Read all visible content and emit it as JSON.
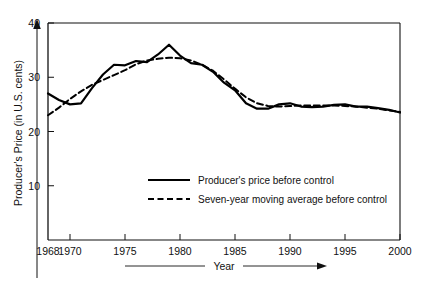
{
  "chart_data": {
    "type": "line",
    "title": "",
    "xlabel": "Year",
    "ylabel": "Producer's Price (in U.S. cents)",
    "xlim": [
      1968,
      2000
    ],
    "ylim": [
      0,
      40
    ],
    "grid": false,
    "legend_position": "center",
    "xticks": [
      1968,
      1970,
      1975,
      1980,
      1985,
      1990,
      1995,
      2000
    ],
    "xtick_labels": [
      "1968",
      "1970",
      "1975",
      "1980",
      "1985",
      "1990",
      "1995",
      "2000"
    ],
    "yticks": [
      10,
      20,
      30,
      40
    ],
    "ytick_labels": [
      "10",
      "20",
      "30",
      "40"
    ],
    "x": [
      1968,
      1969,
      1970,
      1971,
      1972,
      1973,
      1974,
      1975,
      1976,
      1977,
      1978,
      1979,
      1980,
      1981,
      1982,
      1983,
      1984,
      1985,
      1986,
      1987,
      1988,
      1989,
      1990,
      1991,
      1992,
      1993,
      1994,
      1995,
      1996,
      1997,
      1998,
      1999,
      2000
    ],
    "series": [
      {
        "name": "Producer's price before control",
        "style": "solid",
        "color": "#000000",
        "values": [
          27.0,
          25.8,
          25.0,
          25.2,
          28.0,
          30.5,
          32.3,
          32.2,
          33.0,
          32.8,
          34.2,
          36.0,
          34.0,
          32.6,
          32.3,
          31.0,
          29.0,
          27.6,
          25.2,
          24.2,
          24.2,
          25.0,
          25.2,
          24.6,
          24.5,
          24.6,
          24.9,
          25.0,
          24.6,
          24.6,
          24.3,
          24.0,
          23.5
        ]
      },
      {
        "name": "Seven-year moving average before control",
        "style": "dashed",
        "color": "#000000",
        "values": [
          23.0,
          24.4,
          26.0,
          27.4,
          28.6,
          29.5,
          30.4,
          31.3,
          32.4,
          33.1,
          33.4,
          33.6,
          33.5,
          33.1,
          32.3,
          31.2,
          29.6,
          27.9,
          26.3,
          25.2,
          24.7,
          24.6,
          24.7,
          24.8,
          24.8,
          24.8,
          24.8,
          24.7,
          24.6,
          24.4,
          24.2,
          23.9,
          23.6
        ]
      }
    ]
  },
  "legend": {
    "entries": [
      {
        "label": "Producer's price before control",
        "style": "solid"
      },
      {
        "label": "Seven-year moving average before control",
        "style": "dashed"
      }
    ]
  },
  "axes": {
    "y_title": "Producer's Price (in U.S. cents)",
    "x_title": "Year"
  }
}
